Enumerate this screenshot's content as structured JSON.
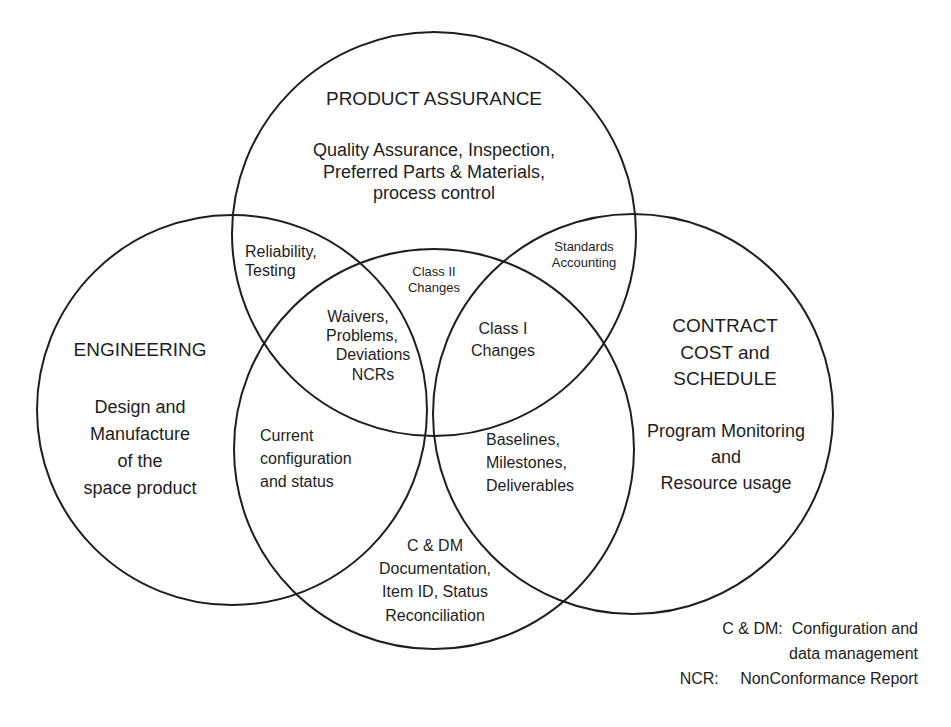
{
  "diagram": {
    "type": "venn",
    "stroke_color": "#1e1e1e",
    "background": "#ffffff",
    "circles": [
      {
        "id": "product-assurance",
        "cx": 434,
        "cy": 234,
        "r": 202
      },
      {
        "id": "engineering",
        "cx": 232,
        "cy": 410,
        "r": 195
      },
      {
        "id": "config-data-mgmt",
        "cx": 434,
        "cy": 449,
        "r": 200
      },
      {
        "id": "contract-cost-schedule",
        "cx": 633,
        "cy": 414,
        "r": 200
      }
    ]
  },
  "product_assurance": {
    "title": "PRODUCT ASSURANCE",
    "desc_lines": [
      "Quality Assurance, Inspection,",
      "Preferred Parts & Materials,",
      "process control"
    ]
  },
  "engineering": {
    "title": "ENGINEERING",
    "desc_lines": [
      "Design and",
      "Manufacture",
      "of the",
      "space product"
    ]
  },
  "contract": {
    "title_lines": [
      "CONTRACT",
      "COST and",
      "SCHEDULE"
    ],
    "desc_lines": [
      "Program Monitoring",
      "and",
      "Resource usage"
    ]
  },
  "overlaps": {
    "reliability": [
      "Reliability,",
      "Testing"
    ],
    "standards": [
      "Standards",
      "Accounting"
    ],
    "class2": [
      "Class II",
      "Changes"
    ],
    "waivers": [
      "Waivers,",
      "Problems,",
      "Deviations",
      "NCRs"
    ],
    "class1": [
      "Class I",
      "Changes"
    ],
    "current_config": [
      "Current",
      "configuration",
      "and status"
    ],
    "baselines": [
      "Baselines,",
      "Milestones,",
      "Deliverables"
    ],
    "cdm": [
      "C & DM",
      "Documentation,",
      "Item ID, Status",
      "Reconciliation"
    ]
  },
  "legend": {
    "items": [
      {
        "abbr": "C & DM:",
        "def_lines": [
          "Configuration and",
          "data management"
        ]
      },
      {
        "abbr": "NCR:",
        "def_lines": [
          "NonConformance Report"
        ]
      }
    ]
  }
}
